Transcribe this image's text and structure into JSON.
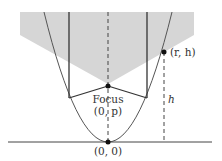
{
  "diagram": {
    "labels": {
      "focus_word": "Focus",
      "focus_coord": "(0, p)",
      "origin": "(0, 0)",
      "point": "(r, h)",
      "height": "h"
    },
    "colors": {
      "shade": "#d6d6d6",
      "line": "#3a3a3a",
      "background": "#ffffff"
    }
  }
}
